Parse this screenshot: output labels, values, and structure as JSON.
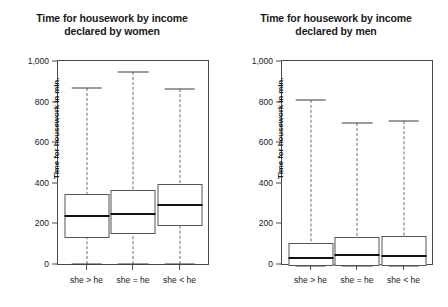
{
  "chart_data": [
    {
      "type": "box",
      "panel_id": "women",
      "title": "Time for housework by income declared by women",
      "title_lines": [
        "Time for housework by income",
        "declared by women"
      ],
      "xlabel": "",
      "ylabel": "Time for housework in min.",
      "ylim": [
        0,
        1000
      ],
      "yticks": [
        0,
        200,
        400,
        600,
        800,
        1000
      ],
      "ytick_labels": [
        "0",
        "200",
        "400",
        "600",
        "800",
        "1,000"
      ],
      "grid": false,
      "legend": "none",
      "categories": [
        "she > he",
        "she = he",
        "she < he"
      ],
      "boxes": [
        {
          "category": "she > he",
          "whisker_low": 0,
          "q1": 130,
          "median": 237,
          "q3": 345,
          "whisker_high": 865
        },
        {
          "category": "she = he",
          "whisker_low": 0,
          "q1": 148,
          "median": 247,
          "q3": 365,
          "whisker_high": 945
        },
        {
          "category": "she < he",
          "whisker_low": 0,
          "q1": 188,
          "median": 292,
          "q3": 395,
          "whisker_high": 860
        }
      ]
    },
    {
      "type": "box",
      "panel_id": "men",
      "title": "Time for housework by income declared by men",
      "title_lines": [
        "Time for housework by income",
        "declared by men"
      ],
      "xlabel": "",
      "ylabel": "Time for housework in min.",
      "ylim": [
        0,
        1000
      ],
      "yticks": [
        0,
        200,
        400,
        600,
        800,
        1000
      ],
      "ytick_labels": [
        "0",
        "200",
        "400",
        "600",
        "800",
        "1,000"
      ],
      "grid": false,
      "legend": "none",
      "categories": [
        "she > he",
        "she = he",
        "she < he"
      ],
      "boxes": [
        {
          "category": "she > he",
          "whisker_low": -10,
          "q1": -10,
          "median": 28,
          "q3": 105,
          "whisker_high": 810
        },
        {
          "category": "she = he",
          "whisker_low": -10,
          "q1": -10,
          "median": 45,
          "q3": 133,
          "whisker_high": 697
        },
        {
          "category": "she < he",
          "whisker_low": -12,
          "q1": -12,
          "median": 40,
          "q3": 140,
          "whisker_high": 703
        }
      ]
    }
  ],
  "colors": {
    "frame": "#4a4a4a",
    "box_border": "#555555",
    "median": "#111111",
    "whisker": "#6e6e6e",
    "background": "#ffffff",
    "text": "#1a1a1a"
  }
}
